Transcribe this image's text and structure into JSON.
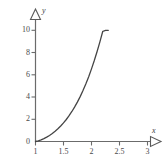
{
  "chart_data": {
    "type": "line",
    "title": "",
    "subtitle": "",
    "xlabel": "x",
    "ylabel": "y",
    "xlim": [
      1,
      3.25
    ],
    "ylim": [
      0,
      10.6
    ],
    "grid": false,
    "legend": null,
    "x_ticks": [
      {
        "value": 1,
        "label": "1"
      },
      {
        "value": 1.5,
        "label": "1.5"
      },
      {
        "value": 2,
        "label": "2"
      },
      {
        "value": 2.5,
        "label": "2.5"
      },
      {
        "value": 3,
        "label": "3"
      }
    ],
    "y_ticks": [
      {
        "value": 0,
        "label": "0"
      },
      {
        "value": 2,
        "label": "2"
      },
      {
        "value": 4,
        "label": "4"
      },
      {
        "value": 6,
        "label": "6"
      },
      {
        "value": 8,
        "label": "8"
      },
      {
        "value": 10,
        "label": "10"
      }
    ],
    "origin_label": "0",
    "series": [
      {
        "name": "curve",
        "color": "#454545",
        "x": [
          1.0,
          1.05,
          1.1,
          1.15,
          1.2,
          1.25,
          1.3,
          1.35,
          1.4,
          1.45,
          1.5,
          1.55,
          1.6,
          1.65,
          1.7,
          1.75,
          1.8,
          1.85,
          1.9,
          1.95,
          2.0,
          2.05,
          2.1,
          2.15,
          2.2,
          2.25,
          2.3
        ],
        "values": [
          0.0,
          0.06,
          0.15,
          0.26,
          0.39,
          0.54,
          0.72,
          0.92,
          1.14,
          1.39,
          1.67,
          1.98,
          2.32,
          2.7,
          3.11,
          3.56,
          4.06,
          4.6,
          5.19,
          5.83,
          6.53,
          7.28,
          8.09,
          8.96,
          9.89,
          10.0,
          10.0
        ]
      }
    ],
    "annotations": []
  },
  "axes": {
    "x_arrow_label": "x",
    "y_arrow_label": "y"
  }
}
